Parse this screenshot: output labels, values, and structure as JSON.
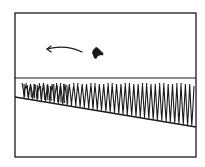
{
  "illustration": {
    "description": "Hand-drawn sketch: framed panel with sky, a small dark bird/bug flying left indicated by a motion arrow, a horizon line, a field of tall grass, and a sloping ground line.",
    "colors": {
      "ink": "#1a1a1a",
      "paper": "#ffffff"
    },
    "frame": {
      "x": 15,
      "y": 13,
      "width": 181,
      "height": 144
    },
    "horizon_y": 78,
    "ground_line": {
      "x1": 15,
      "y1": 97,
      "x2": 196,
      "y2": 127
    },
    "creature": {
      "name": "flying-creature",
      "cx": 98,
      "cy": 53
    },
    "motion_arrow": {
      "direction": "left",
      "from_x": 82,
      "to_x": 47,
      "y": 50
    },
    "grass": {
      "top_y": 84,
      "blade_count": 40
    }
  }
}
